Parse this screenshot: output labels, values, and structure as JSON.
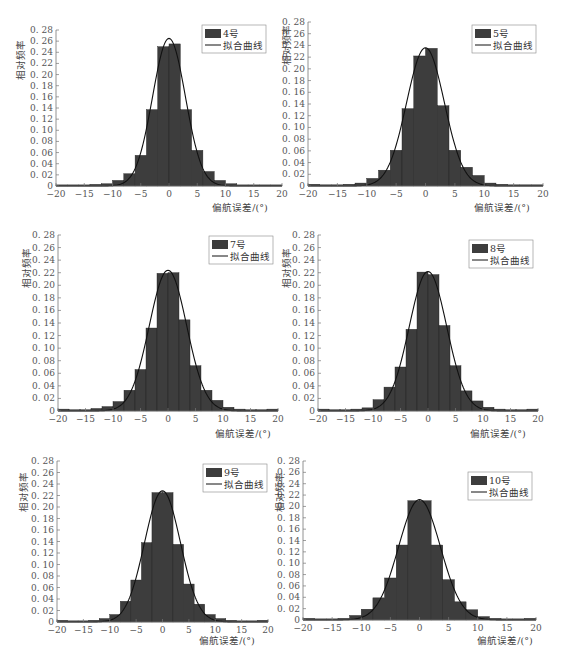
{
  "colors": {
    "bar": "#3d3d3d",
    "bar_stroke": "#1e1e1e",
    "curve": "#111111",
    "axis": "#777777",
    "text": "#555555"
  },
  "chart_data": [
    {
      "type": "bar",
      "title": "",
      "legend": [
        "4号",
        "拟合曲线"
      ],
      "xlabel": "偏航误差/(°)",
      "ylabel": "相对频率",
      "xlim": [
        -20,
        20
      ],
      "ylim": [
        0,
        0.28
      ],
      "xticks": [
        "-20",
        "-15",
        "-10",
        "-5",
        "0",
        "5",
        "10",
        "15",
        "20"
      ],
      "yticks": [
        "0",
        "0.02",
        "0.04",
        "0.06",
        "0.08",
        "0.10",
        "0.12",
        "0.14",
        "0.16",
        "0.18",
        "0.20",
        "0.22",
        "0.24",
        "0.26",
        "0.28"
      ],
      "bin_edges": [
        -20,
        -18,
        -16,
        -14,
        -12,
        -10,
        -8,
        -6,
        -4,
        -2,
        0,
        2,
        4,
        6,
        8,
        10,
        12,
        14,
        16,
        18,
        20
      ],
      "values": [
        0.002,
        0.002,
        0.002,
        0.003,
        0.004,
        0.01,
        0.022,
        0.055,
        0.137,
        0.25,
        0.255,
        0.137,
        0.064,
        0.026,
        0.01,
        0.004,
        0.002,
        0.002,
        0.002,
        0.002
      ],
      "fit_curve": {
        "type": "normal",
        "mean": 0.0,
        "peak": 0.265,
        "sigma": 2.9
      },
      "grid": false,
      "legend_position": "upper right"
    },
    {
      "type": "bar",
      "title": "",
      "legend": [
        "5号",
        "拟合曲线"
      ],
      "xlabel": "偏航误差/(°)",
      "ylabel": "相对频率",
      "xlim": [
        -20,
        20
      ],
      "ylim": [
        0,
        0.28
      ],
      "xticks": [
        "-20",
        "-15",
        "-10",
        "-5",
        "0",
        "5",
        "10",
        "15",
        "20"
      ],
      "yticks": [
        "0",
        "0.02",
        "0.04",
        "0.06",
        "0.08",
        "0.10",
        "0.12",
        "0.14",
        "0.16",
        "0.18",
        "0.20",
        "0.22",
        "0.24",
        "0.26",
        "0.28"
      ],
      "bin_edges": [
        -20,
        -18,
        -16,
        -14,
        -12,
        -10,
        -8,
        -6,
        -4,
        -2,
        0,
        2,
        4,
        6,
        8,
        10,
        12,
        14,
        16,
        18,
        20
      ],
      "values": [
        0.003,
        0.002,
        0.002,
        0.003,
        0.005,
        0.013,
        0.027,
        0.061,
        0.132,
        0.222,
        0.235,
        0.137,
        0.061,
        0.032,
        0.018,
        0.005,
        0.003,
        0.002,
        0.002,
        0.002
      ],
      "fit_curve": {
        "type": "normal",
        "mean": 0.0,
        "peak": 0.236,
        "sigma": 3.2
      },
      "grid": false,
      "legend_position": "upper right"
    },
    {
      "type": "bar",
      "title": "",
      "legend": [
        "7号",
        "拟合曲线"
      ],
      "xlabel": "偏航误差/(°)",
      "ylabel": "相对频率",
      "xlim": [
        -20,
        20
      ],
      "ylim": [
        0,
        0.28
      ],
      "xticks": [
        "-20",
        "-15",
        "-10",
        "-5",
        "0",
        "5",
        "10",
        "15",
        "20"
      ],
      "yticks": [
        "0",
        "0.02",
        "0.04",
        "0.06",
        "0.08",
        "0.10",
        "0.12",
        "0.14",
        "0.16",
        "0.18",
        "0.20",
        "0.22",
        "0.24",
        "0.26",
        "0.28"
      ],
      "bin_edges": [
        -20,
        -18,
        -16,
        -14,
        -12,
        -10,
        -8,
        -6,
        -4,
        -2,
        0,
        2,
        4,
        6,
        8,
        10,
        12,
        14,
        16,
        18,
        20
      ],
      "values": [
        0.003,
        0.002,
        0.002,
        0.004,
        0.007,
        0.015,
        0.033,
        0.066,
        0.132,
        0.219,
        0.22,
        0.145,
        0.072,
        0.033,
        0.017,
        0.006,
        0.003,
        0.002,
        0.002,
        0.003
      ],
      "fit_curve": {
        "type": "normal",
        "mean": 0.0,
        "peak": 0.224,
        "sigma": 3.4
      },
      "grid": false,
      "legend_position": "upper right"
    },
    {
      "type": "bar",
      "title": "",
      "legend": [
        "8号",
        "拟合曲线"
      ],
      "xlabel": "偏航误差/(°)",
      "ylabel": "相对频率",
      "xlim": [
        -20,
        20
      ],
      "ylim": [
        0,
        0.28
      ],
      "xticks": [
        "-20",
        "-15",
        "-10",
        "-5",
        "0",
        "5",
        "10",
        "15",
        "20"
      ],
      "yticks": [
        "0",
        "0.02",
        "0.04",
        "0.06",
        "0.08",
        "0.10",
        "0.12",
        "0.14",
        "0.16",
        "0.18",
        "0.20",
        "0.22",
        "0.24",
        "0.26",
        "0.28"
      ],
      "bin_edges": [
        -20,
        -18,
        -16,
        -14,
        -12,
        -10,
        -8,
        -6,
        -4,
        -2,
        0,
        2,
        4,
        6,
        8,
        10,
        12,
        14,
        16,
        18,
        20
      ],
      "values": [
        0.003,
        0.002,
        0.002,
        0.003,
        0.005,
        0.018,
        0.038,
        0.07,
        0.13,
        0.221,
        0.217,
        0.136,
        0.072,
        0.032,
        0.016,
        0.006,
        0.003,
        0.002,
        0.002,
        0.003
      ],
      "fit_curve": {
        "type": "normal",
        "mean": 0.0,
        "peak": 0.222,
        "sigma": 3.4
      },
      "grid": false,
      "legend_position": "upper right"
    },
    {
      "type": "bar",
      "title": "",
      "legend": [
        "9号",
        "拟合曲线"
      ],
      "xlabel": "偏航误差/(°)",
      "ylabel": "相对频率",
      "xlim": [
        -20,
        20
      ],
      "ylim": [
        0,
        0.28
      ],
      "xticks": [
        "-20",
        "-15",
        "-10",
        "-5",
        "0",
        "5",
        "10",
        "15",
        "20"
      ],
      "yticks": [
        "0",
        "0.02",
        "0.04",
        "0.06",
        "0.08",
        "0.10",
        "0.12",
        "0.14",
        "0.16",
        "0.18",
        "0.20",
        "0.22",
        "0.24",
        "0.26",
        "0.28"
      ],
      "bin_edges": [
        -20,
        -18,
        -16,
        -14,
        -12,
        -10,
        -8,
        -6,
        -4,
        -2,
        0,
        2,
        4,
        6,
        8,
        10,
        12,
        14,
        16,
        18,
        20
      ],
      "values": [
        0.003,
        0.002,
        0.002,
        0.003,
        0.006,
        0.013,
        0.036,
        0.073,
        0.138,
        0.225,
        0.225,
        0.135,
        0.066,
        0.031,
        0.013,
        0.006,
        0.003,
        0.002,
        0.002,
        0.003
      ],
      "fit_curve": {
        "type": "normal",
        "mean": 0.0,
        "peak": 0.228,
        "sigma": 3.4
      },
      "grid": false,
      "legend_position": "upper right"
    },
    {
      "type": "bar",
      "title": "",
      "legend": [
        "10号",
        "拟合曲线"
      ],
      "xlabel": "偏航误差/(°)",
      "ylabel": "相对频率",
      "xlim": [
        -20,
        20
      ],
      "ylim": [
        0,
        0.28
      ],
      "xticks": [
        "-20",
        "-15",
        "-10",
        "-5",
        "0",
        "5",
        "10",
        "15",
        "20"
      ],
      "yticks": [
        "0",
        "0.02",
        "0.04",
        "0.06",
        "0.08",
        "0.10",
        "0.12",
        "0.14",
        "0.16",
        "0.18",
        "0.20",
        "0.22",
        "0.24",
        "0.26",
        "0.28"
      ],
      "bin_edges": [
        -20,
        -18,
        -16,
        -14,
        -12,
        -10,
        -8,
        -6,
        -4,
        -2,
        0,
        2,
        4,
        6,
        8,
        10,
        12,
        14,
        16,
        18,
        20
      ],
      "values": [
        0.003,
        0.002,
        0.002,
        0.003,
        0.008,
        0.019,
        0.039,
        0.074,
        0.132,
        0.21,
        0.21,
        0.132,
        0.071,
        0.032,
        0.018,
        0.006,
        0.003,
        0.002,
        0.002,
        0.003
      ],
      "fit_curve": {
        "type": "normal",
        "mean": 0.0,
        "peak": 0.212,
        "sigma": 3.6
      },
      "grid": false,
      "legend_position": "upper right"
    }
  ],
  "layout": [
    {
      "x0": 56,
      "x1": 282,
      "y0": 186,
      "y1": 30,
      "legend": {
        "x": 202,
        "y": 25
      },
      "xlabel_x": 240,
      "xlabel_y": 211,
      "ylabel_x": 24,
      "ylabel_y": 60
    },
    {
      "x0": 308,
      "x1": 543,
      "y0": 186,
      "y1": 22,
      "legend": {
        "x": 472,
        "y": 25
      },
      "xlabel_x": 502,
      "xlabel_y": 211,
      "ylabel_x": 290,
      "ylabel_y": 45
    },
    {
      "x0": 58,
      "x1": 278,
      "y0": 411,
      "y1": 235,
      "legend": {
        "x": 209,
        "y": 236
      },
      "xlabel_x": 243,
      "xlabel_y": 437,
      "ylabel_x": 30,
      "ylabel_y": 268
    },
    {
      "x0": 318,
      "x1": 538,
      "y0": 411,
      "y1": 235,
      "legend": {
        "x": 469,
        "y": 240
      },
      "xlabel_x": 498,
      "xlabel_y": 437,
      "ylabel_x": 290,
      "ylabel_y": 268
    },
    {
      "x0": 57,
      "x1": 268,
      "y0": 622,
      "y1": 461,
      "legend": {
        "x": 203,
        "y": 464
      },
      "xlabel_x": 227,
      "xlabel_y": 644,
      "ylabel_x": 27,
      "ylabel_y": 492
    },
    {
      "x0": 303,
      "x1": 536,
      "y0": 620,
      "y1": 461,
      "legend": {
        "x": 468,
        "y": 472
      },
      "xlabel_x": 505,
      "xlabel_y": 644,
      "ylabel_x": 283,
      "ylabel_y": 492
    }
  ]
}
